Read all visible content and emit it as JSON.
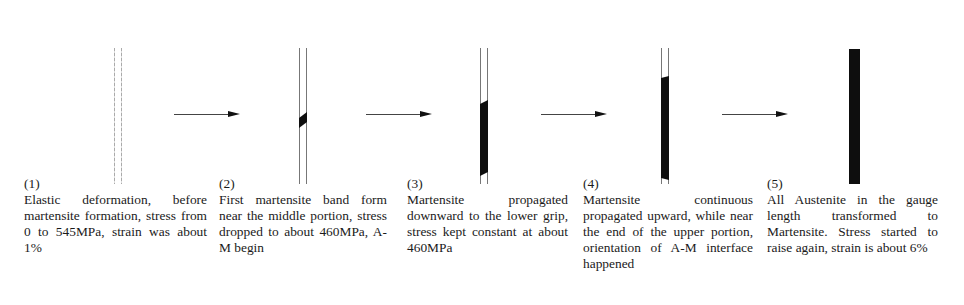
{
  "figure": {
    "colors": {
      "martensite": "#0e0e0e",
      "austenite_outline": "#777777",
      "arrow": "#444444"
    },
    "stages": [
      {
        "number": "(1)",
        "text": "Elastic deformation, before martensite formation, stress from  0  to 545MPa, strain was about 1%",
        "martensite_fraction": 0
      },
      {
        "number": "(2)",
        "text": "First martensite band form near the middle portion, stress dropped to about 460MPa, A-M begin",
        "martensite_fraction": 0.08
      },
      {
        "number": "(3)",
        "text": "Martensite propagated downward to the lower grip, stress kept constant at about 460MPa",
        "martensite_fraction": 0.6
      },
      {
        "number": "(4)",
        "text": "Martensite continuous propagated upward, while near the end of the upper portion, orientation of A-M interface happened",
        "martensite_fraction": 0.85
      },
      {
        "number": "(5)",
        "text": "All Austenite in the gauge length transformed to Martensite. Stress started to raise again, strain is about 6%",
        "martensite_fraction": 1
      }
    ],
    "arrows": [
      "arrow-1-2",
      "arrow-2-3",
      "arrow-3-4",
      "arrow-4-5"
    ]
  }
}
